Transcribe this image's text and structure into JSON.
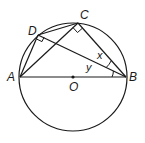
{
  "diagram": {
    "type": "circle-geometry",
    "points": {
      "A": {
        "label": "A",
        "x": 20,
        "y": 77
      },
      "B": {
        "label": "B",
        "x": 126,
        "y": 77
      },
      "C": {
        "label": "C",
        "x": 78,
        "y": 23
      },
      "D": {
        "label": "D",
        "x": 38,
        "y": 35
      },
      "O": {
        "label": "O",
        "x": 73,
        "y": 77
      }
    },
    "circle": {
      "cx": 73,
      "cy": 77,
      "r": 54
    },
    "angles": {
      "x": {
        "label": "x"
      },
      "y": {
        "label": "y"
      }
    },
    "segments": [
      "AB",
      "AC",
      "AD",
      "DC",
      "DB",
      "CB"
    ],
    "right_angles": [
      "D",
      "C"
    ],
    "stroke_color": "#1a1a1a"
  }
}
